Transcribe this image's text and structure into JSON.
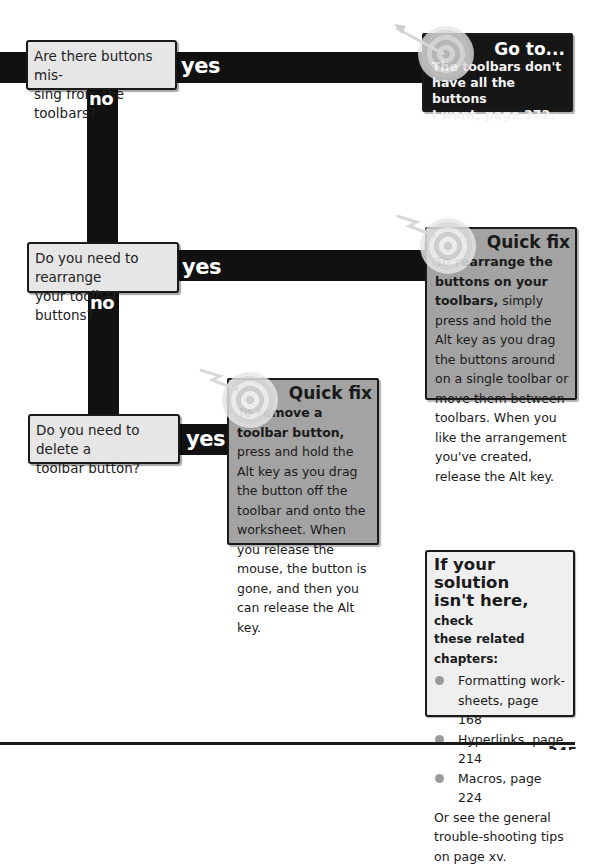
{
  "flowchart": {
    "questions": [
      {
        "text": "Are there buttons mis-sing from the toolbars?",
        "line1": "Are there buttons mis-",
        "line2": "sing from the toolbars?"
      },
      {
        "text": "Do you need to rearrange your toolbar buttons?",
        "line1": "Do you need to rearrange",
        "line2": "your toolbar buttons?"
      },
      {
        "text": "Do you need to delete a toolbar button?",
        "line1": "Do you need to delete a",
        "line2": "toolbar button?"
      }
    ],
    "yes_label": "yes",
    "no_label": "no"
  },
  "goto_box": {
    "title": "Go to...",
    "line1": "The toolbars don't",
    "line2": "have all the buttons",
    "line3": "I want, page 372.",
    "icon": "target-arrow-icon"
  },
  "quickfix_1": {
    "title": "Quick fix",
    "lead": "To rearrange the buttons on your toolbars,",
    "body": " simply press and hold the Alt key as you drag the buttons around on a single toolbar or move them between toolbars. When you like the arrangement you've created, release the Alt key.",
    "icon": "target-arrow-icon"
  },
  "quickfix_2": {
    "title": "Quick fix",
    "lead": "To remove a toolbar button,",
    "body": " press and hold the Alt key as you drag the button off the toolbar and onto the worksheet. When you release the mouse, the button is gone, and then you can release the Alt key.",
    "icon": "target-arrow-icon"
  },
  "related": {
    "heading_line1": "If your solution",
    "heading_line2": "isn't here,",
    "heading_check": " check",
    "heading_line3": "these related chapters:",
    "items": [
      {
        "text": "Formatting work-sheets, page 168"
      },
      {
        "text": "Hyperlinks, page 214"
      },
      {
        "text": "Macros, page 224"
      }
    ],
    "footer": "Or see the general trouble-shooting tips on page xv."
  },
  "footer": {
    "page_number": "345"
  },
  "colors": {
    "bar": "#111111",
    "question_bg": "#e6e6e6",
    "goto_bg": "#161616",
    "quickfix_bg": "#a3a3a3",
    "related_bg": "#efefef",
    "bullet": "#9a9a9a"
  }
}
